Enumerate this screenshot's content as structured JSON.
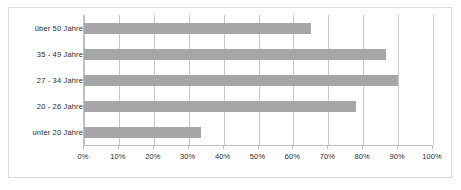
{
  "chart_data": {
    "type": "bar",
    "orientation": "horizontal",
    "title": "",
    "subtitle": "",
    "xlabel": "",
    "ylabel": "",
    "categories": [
      "über 50 Jahre",
      "35 - 49 Jahre",
      "27 - 34 Jahre",
      "20 - 26 Jahre",
      "unter 20 Jahre"
    ],
    "values": [
      65,
      86.5,
      90,
      78,
      33.5
    ],
    "xlim": [
      0,
      100
    ],
    "xticks": [
      0,
      10,
      20,
      30,
      40,
      50,
      60,
      70,
      80,
      90,
      100
    ],
    "xtick_labels": [
      "0%",
      "10%",
      "20%",
      "30%",
      "40%",
      "50%",
      "60%",
      "70%",
      "80%",
      "90%",
      "100%"
    ],
    "grid": true,
    "grid_axis": "x",
    "legend": false,
    "legend_position": "none",
    "series": [
      {
        "name": "",
        "values": [
          65,
          86.5,
          90,
          78,
          33.5
        ]
      }
    ]
  },
  "style": {
    "bar_color": "#a6a6a6",
    "gridline_color": "#c9c9c9",
    "axis_color": "#bfbfbf",
    "frame_color": "#d9d9d9",
    "text_color": "#2b2b2b",
    "background": "#ffffff"
  }
}
